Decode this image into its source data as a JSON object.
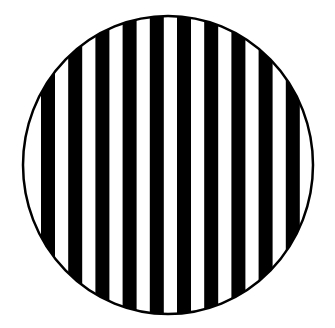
{
  "figure": {
    "background_color": "#ffffff",
    "stripe_color": "#000000",
    "outline_color": "#000000",
    "circle": {
      "cx": 168,
      "cy": 165,
      "rx": 145,
      "ry": 149,
      "stroke_width": 2.5
    },
    "stripes": {
      "count": 10,
      "first_x": 41,
      "period": 27.2,
      "width": 14
    }
  }
}
